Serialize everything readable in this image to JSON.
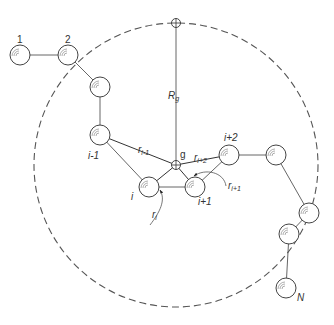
{
  "diagram": {
    "type": "polymer-chain-radius-of-gyration",
    "colors": {
      "stroke": "#444444",
      "dashed_circle": "#555555",
      "background": "#ffffff"
    },
    "center": {
      "label": "g",
      "x": 176,
      "y": 165
    },
    "top_marker": {
      "x": 176,
      "y": 23
    },
    "radius_label": {
      "main": "R",
      "sub": "g"
    },
    "boundary_circle": {
      "cx": 176,
      "cy": 165,
      "r": 142,
      "style": "dashed"
    },
    "nodes": [
      {
        "id": "n1",
        "label": "1",
        "x": 20,
        "y": 55,
        "label_x": 17,
        "label_y": 43,
        "italic": false
      },
      {
        "id": "n2",
        "label": "2",
        "x": 68,
        "y": 55,
        "label_x": 65,
        "label_y": 43,
        "italic": false
      },
      {
        "id": "n3",
        "label": "",
        "x": 100,
        "y": 87
      },
      {
        "id": "n_im1",
        "label": "i-1",
        "x": 100,
        "y": 135,
        "label_x": 88,
        "label_y": 159,
        "italic": true
      },
      {
        "id": "n_i",
        "label": "i",
        "x": 149,
        "y": 187,
        "label_x": 131,
        "label_y": 200,
        "italic": true
      },
      {
        "id": "n_ip1",
        "label": "i+1",
        "x": 195,
        "y": 187,
        "label_x": 198,
        "label_y": 205,
        "italic": true
      },
      {
        "id": "n_ip2",
        "label": "i+2",
        "x": 229,
        "y": 155,
        "label_x": 224,
        "label_y": 141,
        "italic": true
      },
      {
        "id": "n6",
        "label": "",
        "x": 276,
        "y": 155
      },
      {
        "id": "n7",
        "label": "",
        "x": 309,
        "y": 213
      },
      {
        "id": "n8",
        "label": "",
        "x": 289,
        "y": 234
      },
      {
        "id": "nN",
        "label": "N",
        "x": 286,
        "y": 288,
        "label_x": 297,
        "label_y": 301,
        "italic": true
      }
    ],
    "chain_order": [
      "n1",
      "n2",
      "n3",
      "n_im1",
      "n_i",
      "n_ip1",
      "n_ip2",
      "n6",
      "n7",
      "n8",
      "nN"
    ],
    "vectors": [
      {
        "label": "r",
        "sub": "i-1",
        "to": "n_im1",
        "label_x": 138,
        "label_y": 153
      },
      {
        "label": "r",
        "sub": "i+2",
        "to": "n_ip2",
        "label_x": 194,
        "label_y": 161
      },
      {
        "label": "r",
        "sub": "i+1",
        "to": "n_ip1",
        "label_x": 228,
        "label_y": 189,
        "curved_pointer": true
      },
      {
        "label": "r",
        "sub": "i",
        "to": "n_i",
        "label_x": 152,
        "label_y": 218,
        "curved_pointer": true
      }
    ]
  }
}
